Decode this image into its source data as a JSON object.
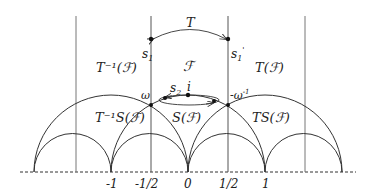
{
  "diagram": {
    "regions": {
      "F": "ℱ",
      "T_inv_F": "T⁻¹(ℱ)",
      "T_F": "T(ℱ)",
      "T_inv_S_F": "T⁻¹S(ℱ)",
      "S_F": "S(ℱ)",
      "TS_F": "TS(ℱ)"
    },
    "points": {
      "s1": "s",
      "s1_sub": "1",
      "s1p": "s",
      "s1p_sub": "1",
      "s1p_prime": "'",
      "s2": "s",
      "s2_sub": "2",
      "i": "i",
      "omega": "ω",
      "neg_omega_inv": "-ω",
      "neg_omega_inv_sup": "-1"
    },
    "arrows": {
      "top_label": "T"
    },
    "axis_ticks": [
      "-1",
      "-1/2",
      "0",
      "1/2",
      "1"
    ],
    "colors": {
      "line": "#333333",
      "vline": "#777777",
      "point": "#111111"
    }
  }
}
